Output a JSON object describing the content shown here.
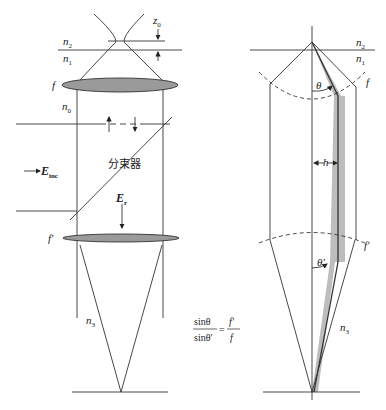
{
  "left_diagram": {
    "labels": {
      "z0": "z",
      "z0_sub": "0",
      "n2": "n",
      "n2_sub": "2",
      "n1": "n",
      "n1_sub": "1",
      "f": "f",
      "n0": "n",
      "n0_sub": "0",
      "E_inc": "E",
      "E_inc_sub": "inc",
      "beam_splitter": "分束器",
      "E_r": "E",
      "E_r_sub": "r",
      "f_prime": "f'",
      "n3": "n",
      "n3_sub": "3"
    }
  },
  "equation": {
    "num_left": "sinθ",
    "den_left": "sinθ'",
    "equals": "=",
    "num_right": "f'",
    "den_right": "f"
  },
  "right_diagram": {
    "labels": {
      "n2": "n",
      "n2_sub": "2",
      "n1": "n",
      "n1_sub": "1",
      "f": "f",
      "theta": "θ",
      "h": "h",
      "f_prime": "f'",
      "theta_prime": "θ'",
      "n3": "n",
      "n3_sub": "3"
    }
  },
  "colors": {
    "line": "#333333",
    "lens_fill": "#9a9a9a",
    "shade": "#bdbdbd",
    "dash": "#555555"
  }
}
